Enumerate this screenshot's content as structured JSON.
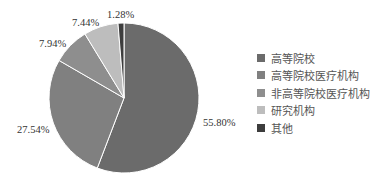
{
  "chart_data": {
    "type": "pie",
    "title": "",
    "categories": [
      "高等院校",
      "高等院校医疗机构",
      "非高等院校医疗机构",
      "研究机构",
      "其他"
    ],
    "values": [
      55.8,
      27.54,
      7.94,
      7.44,
      1.28
    ],
    "value_labels": [
      "55.80%",
      "27.54%",
      "7.94%",
      "7.44%",
      "1.28%"
    ],
    "colors": [
      "#6b6b6b",
      "#808080",
      "#8e8e8e",
      "#bdbdbd",
      "#3d3d3d"
    ],
    "start_angle": "12 o'clock",
    "direction": "clockwise",
    "legend_position": "right"
  },
  "legend": {
    "items": [
      {
        "label": "高等院校",
        "color": "#6b6b6b"
      },
      {
        "label": "高等院校医疗机构",
        "color": "#808080"
      },
      {
        "label": "非高等院校医疗机构",
        "color": "#8e8e8e"
      },
      {
        "label": "研究机构",
        "color": "#bdbdbd"
      },
      {
        "label": "其他",
        "color": "#3d3d3d"
      }
    ]
  }
}
